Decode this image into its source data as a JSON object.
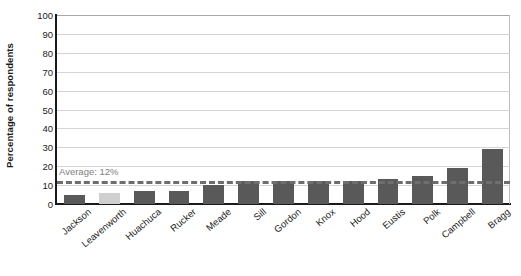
{
  "chart_data": {
    "type": "bar",
    "title": "",
    "xlabel": "",
    "ylabel": "Percentage of respondents",
    "ylim": [
      0,
      100
    ],
    "ytick_values": [
      100,
      90,
      80,
      70,
      60,
      50,
      40,
      30,
      20,
      10,
      0
    ],
    "ytick_labels": [
      "100",
      "90",
      "80",
      "70",
      "60",
      "50",
      "40",
      "30",
      "20",
      "10",
      "0"
    ],
    "grid": true,
    "legend_position": "none",
    "categories": [
      "Jackson",
      "Leavenworth",
      "Huachuca",
      "Rucker",
      "Meade",
      "Sill",
      "Gordon",
      "Knox",
      "Hood",
      "Eustis",
      "Polk",
      "Campbell",
      "Bragg"
    ],
    "values": [
      5,
      6,
      7,
      7,
      10,
      12,
      12,
      12,
      12,
      13,
      15,
      19,
      29
    ],
    "annotations": [
      {
        "name": "average-line",
        "label": "Average: 12%",
        "value": 12,
        "style": "dashed-horizontal"
      }
    ],
    "colors": {
      "bar": "#595959",
      "bar_highlight": "#cfcfcf",
      "average_line": "#6e6e6e",
      "average_label": "#7d7d7d",
      "gridline": "#d4d4d4",
      "axis": "#1a1a1a",
      "background": "#ffffff"
    },
    "highlighted_category": "Leavenworth"
  }
}
